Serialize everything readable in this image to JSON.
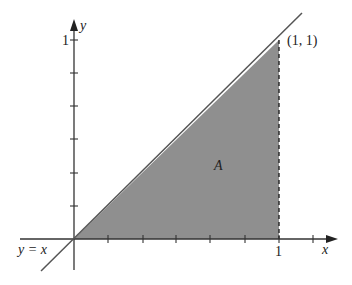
{
  "figure": {
    "region_label": "A",
    "point_label": "(1, 1)",
    "line_label": "y = x",
    "x_axis_label": "x",
    "y_axis_label": "y",
    "x_tick_label": "1",
    "y_tick_label": "1",
    "fill_color": "#8f8f8f",
    "line_color": "#555555",
    "axis_color": "#333333"
  },
  "diagram": {
    "region": {
      "vertices": [
        [
          0,
          0
        ],
        [
          1,
          0
        ],
        [
          1,
          1
        ]
      ]
    },
    "line": {
      "equation": "y = x",
      "x_range": [
        -0.16,
        1.12
      ]
    },
    "x_ticks": [
      0.167,
      0.333,
      0.5,
      0.667,
      0.833,
      1.0,
      1.167
    ],
    "y_ticks": [
      0.167,
      0.333,
      0.5,
      0.667,
      0.833,
      1.0
    ],
    "dashed_line": {
      "from": [
        1,
        0
      ],
      "to": [
        1,
        1
      ]
    }
  }
}
